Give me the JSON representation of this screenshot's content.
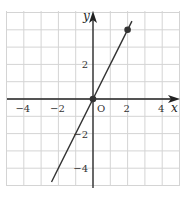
{
  "chart_data": {
    "type": "line",
    "title": "",
    "xlabel": "x",
    "ylabel": "y",
    "origin_label": "O",
    "xlim": [
      -5,
      5
    ],
    "ylim": [
      -5,
      5
    ],
    "grid": true,
    "x_ticks": [
      {
        "value": -4,
        "label": "−4"
      },
      {
        "value": -2,
        "label": "−2"
      },
      {
        "value": 2,
        "label": "2"
      },
      {
        "value": 4,
        "label": "4"
      }
    ],
    "y_ticks": [
      {
        "value": 2,
        "label": "2"
      },
      {
        "value": -2,
        "label": "−2"
      },
      {
        "value": -4,
        "label": "−4"
      }
    ],
    "series": [
      {
        "name": "y = 2x",
        "equation": "y = 2x",
        "x": [
          -2.4,
          2.25
        ],
        "y": [
          -4.8,
          4.5
        ],
        "color": "#333333"
      }
    ],
    "points": [
      {
        "x": 0,
        "y": 0
      },
      {
        "x": 2,
        "y": 4
      }
    ]
  },
  "colors": {
    "grid": "#d4d4d4",
    "axis": "#222222",
    "line": "#333333",
    "point": "#333333"
  }
}
